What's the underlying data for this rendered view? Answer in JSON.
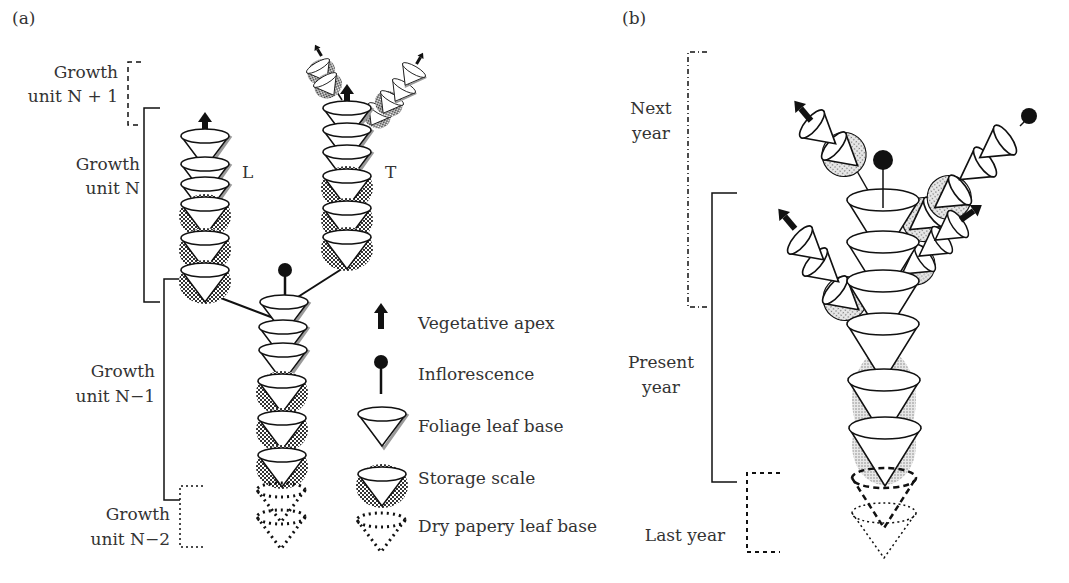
{
  "panels": {
    "a": {
      "label": "(a)",
      "growth_units": [
        {
          "line1": "Growth",
          "line2": "unit N + 1",
          "bracket": "dashed"
        },
        {
          "line1": "Growth",
          "line2": "unit N",
          "bracket": "solid"
        },
        {
          "line1": "Growth",
          "line2": "unit N−1",
          "bracket": "solid"
        },
        {
          "line1": "Growth",
          "line2": "unit N−2",
          "bracket": "dotted"
        }
      ],
      "branch_labels": {
        "left": "L",
        "right": "T"
      }
    },
    "b": {
      "label": "(b)",
      "periods": [
        {
          "line1": "Next",
          "line2": "year",
          "bracket": "dash-dot"
        },
        {
          "line1": "Present",
          "line2": "year",
          "bracket": "solid"
        },
        {
          "line1": "Last year",
          "line2": "",
          "bracket": "dashed"
        }
      ]
    }
  },
  "legend": [
    {
      "icon": "vegetative-apex-icon",
      "label": "Vegetative apex"
    },
    {
      "icon": "inflorescence-icon",
      "label": "Inflorescence"
    },
    {
      "icon": "foliage-leaf-base-icon",
      "label": "Foliage leaf base"
    },
    {
      "icon": "storage-scale-icon",
      "label": "Storage scale"
    },
    {
      "icon": "dry-papery-leaf-base-icon",
      "label": "Dry papery leaf base"
    }
  ],
  "colors": {
    "ink": "#111111",
    "text": "#333333",
    "foliage_shadow": "#9a9a9a",
    "storage_fill": "#555555"
  }
}
